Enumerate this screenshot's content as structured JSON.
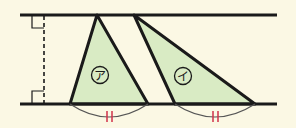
{
  "diagram": {
    "colors": {
      "background": "#fbf8e4",
      "triangle_fill": "#d9ebc4",
      "stroke": "#1a1a1a",
      "arc": "#555555",
      "tick_marks": "#d0324a"
    },
    "parallel_lines": {
      "top_y": 15,
      "bottom_y": 104,
      "x_start": 20,
      "x_end": 277
    },
    "perpendicular": {
      "x": 44,
      "style": "dashed",
      "right_angle_markers": 2
    },
    "triangles": [
      {
        "label": "ア",
        "apex": [
          97,
          15
        ],
        "base": [
          [
            70,
            104
          ],
          [
            148,
            104
          ]
        ],
        "label_pos": [
          100,
          75
        ]
      },
      {
        "label": "イ",
        "apex": [
          134,
          15
        ],
        "base": [
          [
            175,
            104
          ],
          [
            255,
            104
          ]
        ],
        "label_pos": [
          183,
          76
        ]
      }
    ],
    "equal_base_mark": "||"
  }
}
